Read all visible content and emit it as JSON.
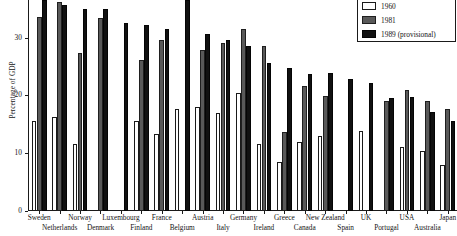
{
  "chart_data": {
    "type": "bar",
    "title": "",
    "subtitle": "",
    "xlabel": "",
    "ylabel": "Percentage of GDP",
    "ylim": [
      0,
      36.5
    ],
    "yticks": [
      0,
      10,
      20,
      30
    ],
    "ytick_labels": [
      "0",
      "10",
      "20",
      "30"
    ],
    "grid": false,
    "legend_position": "top-right",
    "categories": [
      "Sweden",
      "Netherlands",
      "Norway",
      "Denmark",
      "Luxembourg",
      "Finland",
      "France",
      "Belgium",
      "Austria",
      "Italy",
      "Germany",
      "Ireland",
      "Greece",
      "Canada",
      "New Zealand",
      "Spain",
      "UK",
      "Portugal",
      "USA",
      "Australia",
      "Japan"
    ],
    "series": [
      {
        "name": "1960",
        "color": "#ffffff",
        "values": [
          15.6,
          16.2,
          11.6,
          0,
          0,
          15.5,
          13.4,
          17.6,
          18.0,
          16.9,
          20.5,
          11.6,
          8.4,
          12.0,
          12.9,
          0,
          13.9,
          0,
          11.1,
          10.3,
          7.9
        ]
      },
      {
        "name": "1981",
        "color": "#595959",
        "values": [
          33.5,
          36.2,
          27.3,
          33.4,
          0,
          26.2,
          29.6,
          0,
          27.8,
          29.1,
          31.4,
          28.6,
          13.7,
          21.7,
          19.9,
          0,
          0,
          19.1,
          21.0,
          19.1,
          17.7
        ]
      },
      {
        "name": "1989 (provisional)",
        "color": "#111111",
        "values": [
          36.5,
          35.7,
          34.9,
          34.9,
          32.5,
          32.2,
          31.5,
          36.5,
          30.7,
          29.6,
          28.5,
          25.6,
          24.7,
          23.7,
          23.9,
          22.8,
          22.1,
          19.6,
          19.7,
          17.2,
          15.5
        ]
      }
    ]
  },
  "legend": {
    "entries": [
      {
        "label": "1960",
        "swatch": "white-swatch"
      },
      {
        "label": "1981",
        "swatch": "gray-swatch"
      },
      {
        "label": "1989 (provisional)",
        "swatch": "black-swatch"
      }
    ]
  },
  "axis": {
    "y_title": "Percentage of GDP"
  }
}
